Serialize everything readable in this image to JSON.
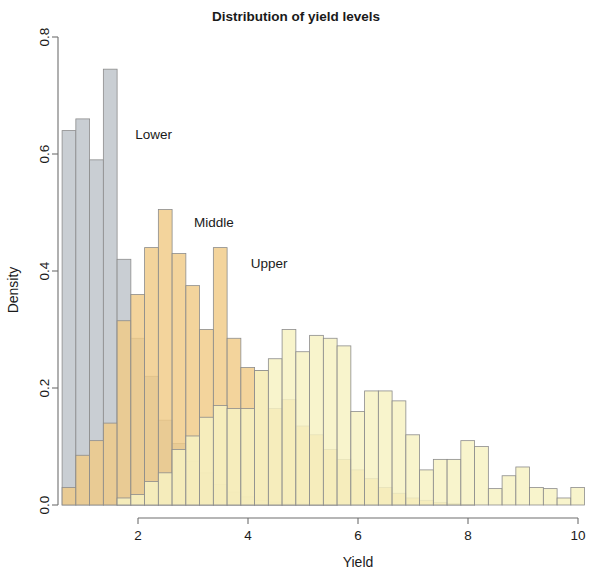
{
  "chart_data": {
    "type": "bar",
    "subtype": "overlaid-histogram",
    "title": "Distribution of yield levels",
    "xlabel": "Yield",
    "ylabel": "Density",
    "xlim": [
      0.55,
      10.0
    ],
    "ylim": [
      0.0,
      0.8
    ],
    "xticks": [
      2,
      4,
      6,
      8,
      10
    ],
    "xticklabels": [
      "2",
      "4",
      "6",
      "8",
      "10"
    ],
    "yticks": [
      0.0,
      0.2,
      0.4,
      0.6,
      0.8
    ],
    "yticklabels": [
      "0.0",
      "0.2",
      "0.4",
      "0.6",
      "0.8"
    ],
    "grid": false,
    "legend_position": "inline-annotations",
    "bin_width": 0.25,
    "annotations": [
      {
        "label": "Lower",
        "x": 1.95,
        "y": 0.625
      },
      {
        "label": "Middle",
        "x": 3.02,
        "y": 0.475
      },
      {
        "label": "Upper",
        "x": 4.05,
        "y": 0.405
      }
    ],
    "colors": {
      "lower": "#c9ced3",
      "middle": "#f0cb86",
      "upper": "#f7f2c2",
      "overlap_lower_middle": "#dcb878",
      "overlap_middle_upper": "#f3dd4f",
      "edge": "#8c8c8c",
      "axis": "#6f6f6f",
      "text": "#1a1a1a"
    },
    "series": [
      {
        "name": "Lower",
        "color": "#c9ced3",
        "bin_start": 0.62,
        "bin_width": 0.25,
        "values": [
          0.64,
          0.66,
          0.59,
          0.745,
          0.42,
          0.285,
          0.22,
          0.145,
          0.105,
          0.075,
          0.055,
          0.035,
          0.022,
          0.014,
          0.008,
          0.005,
          0.003,
          0.002,
          0.001,
          0.001
        ]
      },
      {
        "name": "Middle",
        "color": "#f0cb86",
        "bin_start": 0.62,
        "bin_width": 0.25,
        "values": [
          0.03,
          0.085,
          0.11,
          0.14,
          0.315,
          0.36,
          0.44,
          0.505,
          0.43,
          0.375,
          0.3,
          0.44,
          0.285,
          0.235,
          0.23,
          0.165,
          0.18,
          0.135,
          0.12,
          0.095,
          0.078,
          0.06,
          0.045,
          0.03,
          0.02,
          0.012,
          0.008,
          0.004,
          0.002,
          0.001
        ]
      },
      {
        "name": "Upper",
        "color": "#f7f2c2",
        "bin_start": 1.62,
        "bin_width": 0.25,
        "values": [
          0.012,
          0.018,
          0.04,
          0.055,
          0.095,
          0.118,
          0.15,
          0.17,
          0.165,
          0.165,
          0.23,
          0.25,
          0.3,
          0.262,
          0.29,
          0.285,
          0.272,
          0.16,
          0.195,
          0.195,
          0.178,
          0.12,
          0.06,
          0.078,
          0.078,
          0.11,
          0.1,
          0.028,
          0.05,
          0.065,
          0.03,
          0.028,
          0.012,
          0.03
        ]
      }
    ]
  },
  "title": {
    "text": "Distribution of yield levels"
  },
  "axes": {
    "x_label": "Yield",
    "y_label": "Density"
  }
}
